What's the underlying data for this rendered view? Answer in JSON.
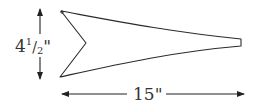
{
  "diagram": {
    "stroke_color": "#2a2a2a",
    "height_dimension": {
      "whole": "4",
      "numerator": "1",
      "slash": "/",
      "denominator": "2",
      "unit": "\"",
      "text": "4 1/2\""
    },
    "width_dimension": {
      "text": "15\""
    }
  }
}
